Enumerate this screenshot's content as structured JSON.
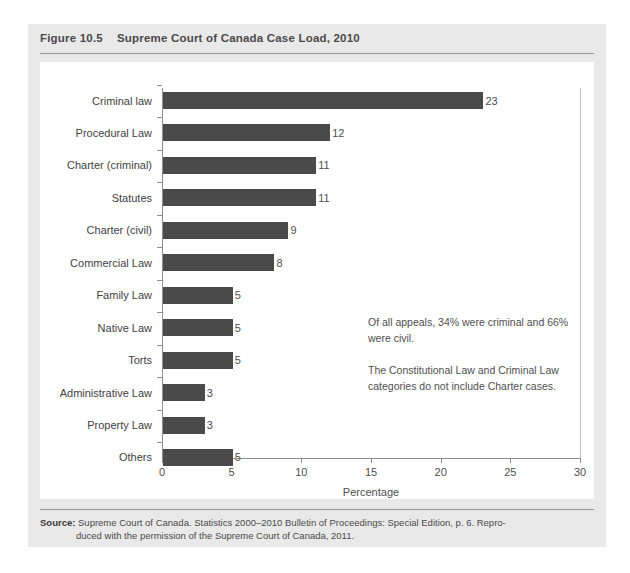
{
  "figure": {
    "number": "Figure 10.5",
    "title": "Supreme Court of Canada Case Load, 2010"
  },
  "chart_data": {
    "type": "bar",
    "orientation": "horizontal",
    "title": "Supreme Court of Canada Case Load, 2010",
    "xlabel": "Percentage",
    "ylabel": "",
    "xlim": [
      0,
      30
    ],
    "xticks": [
      "0",
      "5",
      "10",
      "15",
      "20",
      "25",
      "30"
    ],
    "grid": false,
    "legend": false,
    "bar_color": "#4a4a4a",
    "categories": [
      "Criminal law",
      "Procedural Law",
      "Charter (criminal)",
      "Statutes",
      "Charter (civil)",
      "Commercial Law",
      "Family Law",
      "Native Law",
      "Torts",
      "Administrative Law",
      "Property Law",
      "Others"
    ],
    "values": [
      23,
      12,
      11,
      11,
      9,
      8,
      5,
      5,
      5,
      3,
      3,
      5
    ],
    "value_labels": [
      "23",
      "12",
      "11",
      "11",
      "9",
      "8",
      "5",
      "5",
      "5",
      "3",
      "3",
      "5"
    ],
    "annotations": [
      "Of all appeals, 34% were criminal and 66% were civil.",
      "The Constitutional Law and Criminal Law categories do not include Charter cases."
    ]
  },
  "source": {
    "label": "Source:",
    "line1": "Supreme Court of Canada. Statistics 2000–2010 Bulletin of Proceedings: Special Edition, p. 6. Repro-",
    "line2": "duced with the permission of the Supreme Court of Canada, 2011."
  }
}
